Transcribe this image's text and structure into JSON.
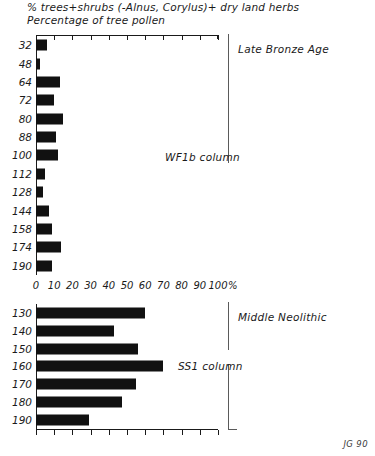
{
  "figure": {
    "title_line1": "% trees+shrubs (-Alnus, Corylus)+ dry land herbs",
    "title_line2": "Percentage of tree pollen",
    "signature": "JG 90",
    "axis_percent_symbol": "%"
  },
  "annotations": {
    "upper_period": "Late Bronze Age",
    "upper_column": "WF1b column",
    "lower_period": "Middle Neolithic",
    "lower_column": "SS1 column"
  },
  "axis": {
    "ticks": [
      0,
      10,
      20,
      30,
      40,
      50,
      60,
      70,
      80,
      90,
      100
    ],
    "tick_labels": [
      "0",
      "10",
      "20",
      "30",
      "40",
      "50",
      "60",
      "70",
      "80",
      "90",
      "100"
    ],
    "min": 0,
    "max": 100
  },
  "chart_data": [
    {
      "type": "bar",
      "orientation": "horizontal",
      "name": "WF1b column",
      "period": "Late Bronze Age",
      "title": "% trees+shrubs (-Alnus, Corylus)+ dry land herbs",
      "subtitle": "Percentage of tree pollen",
      "xlabel": "%",
      "ylabel": "depth (cm)",
      "categories": [
        "32",
        "48",
        "64",
        "72",
        "80",
        "88",
        "100",
        "112",
        "128",
        "144",
        "158",
        "174",
        "190"
      ],
      "values": [
        6,
        2,
        13,
        10,
        15,
        11,
        12,
        5,
        4,
        7,
        9,
        14,
        9
      ],
      "xlim": [
        0,
        100
      ],
      "grid": false,
      "legend": "none"
    },
    {
      "type": "bar",
      "orientation": "horizontal",
      "name": "SS1 column",
      "period": "Middle Neolithic",
      "xlabel": "%",
      "ylabel": "depth (cm)",
      "categories": [
        "130",
        "140",
        "150",
        "160",
        "170",
        "180",
        "190"
      ],
      "values": [
        60,
        43,
        56,
        70,
        55,
        47,
        29
      ],
      "xlim": [
        0,
        100
      ],
      "grid": false,
      "legend": "none"
    }
  ]
}
